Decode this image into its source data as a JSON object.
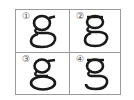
{
  "options": [
    {
      "label": "①",
      "glyph": "g",
      "variant": "double-storey-wide-loop"
    },
    {
      "label": "②",
      "glyph": "g",
      "variant": "double-storey-flat-loop"
    },
    {
      "label": "③",
      "glyph": "g",
      "variant": "double-storey-large-loop"
    },
    {
      "label": "④",
      "glyph": "g",
      "variant": "double-storey-open-tail"
    }
  ],
  "colors": {
    "grid_line": "#9a9a9a",
    "glyph": "#1a1a1a",
    "number": "#555555",
    "background": "#ffffff"
  }
}
